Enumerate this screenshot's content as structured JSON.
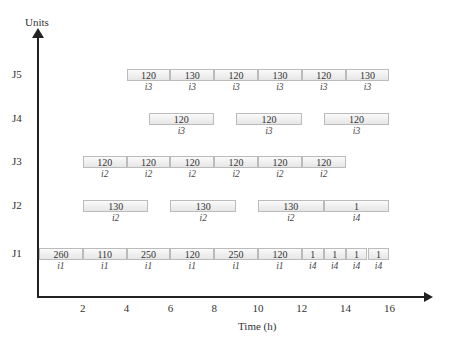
{
  "chart_data": {
    "type": "gantt",
    "title": "",
    "xlabel": "Time (h)",
    "ylabel": "Units",
    "x_ticks": [
      2,
      4,
      6,
      8,
      10,
      12,
      14,
      16
    ],
    "y_categories": [
      "J1",
      "J2",
      "J3",
      "J4",
      "J5"
    ],
    "xlim": [
      0,
      17.5
    ],
    "grid": false,
    "rows": [
      {
        "unit": "J5",
        "tasks": [
          {
            "start": 4,
            "end": 6,
            "value": "120",
            "label": "i3"
          },
          {
            "start": 6,
            "end": 8,
            "value": "130",
            "label": "i3"
          },
          {
            "start": 8,
            "end": 10,
            "value": "120",
            "label": "i3"
          },
          {
            "start": 10,
            "end": 12,
            "value": "130",
            "label": "i3"
          },
          {
            "start": 12,
            "end": 14,
            "value": "120",
            "label": "i3"
          },
          {
            "start": 14,
            "end": 16,
            "value": "130",
            "label": "i3"
          }
        ]
      },
      {
        "unit": "J4",
        "tasks": [
          {
            "start": 5,
            "end": 8,
            "value": "120",
            "label": "i3"
          },
          {
            "start": 9,
            "end": 12,
            "value": "120",
            "label": "i3"
          },
          {
            "start": 13,
            "end": 16,
            "value": "120",
            "label": "i3"
          }
        ]
      },
      {
        "unit": "J3",
        "tasks": [
          {
            "start": 2,
            "end": 4,
            "value": "120",
            "label": "i2"
          },
          {
            "start": 4,
            "end": 6,
            "value": "120",
            "label": "i2"
          },
          {
            "start": 6,
            "end": 8,
            "value": "120",
            "label": "i2"
          },
          {
            "start": 8,
            "end": 10,
            "value": "120",
            "label": "i2"
          },
          {
            "start": 10,
            "end": 12,
            "value": "120",
            "label": "i2"
          },
          {
            "start": 12,
            "end": 14,
            "value": "120",
            "label": "i2"
          }
        ]
      },
      {
        "unit": "J2",
        "tasks": [
          {
            "start": 2,
            "end": 5,
            "value": "130",
            "label": "i2"
          },
          {
            "start": 6,
            "end": 9,
            "value": "130",
            "label": "i2"
          },
          {
            "start": 10,
            "end": 13,
            "value": "130",
            "label": "i2"
          },
          {
            "start": 13,
            "end": 16,
            "value": "1",
            "label": "i4"
          }
        ]
      },
      {
        "unit": "J1",
        "tasks": [
          {
            "start": 0,
            "end": 2,
            "value": "260",
            "label": "i1"
          },
          {
            "start": 2,
            "end": 4,
            "value": "110",
            "label": "i1"
          },
          {
            "start": 4,
            "end": 6,
            "value": "250",
            "label": "i1"
          },
          {
            "start": 6,
            "end": 8,
            "value": "120",
            "label": "i1"
          },
          {
            "start": 8,
            "end": 10,
            "value": "250",
            "label": "i1"
          },
          {
            "start": 10,
            "end": 12,
            "value": "120",
            "label": "i1"
          },
          {
            "start": 12,
            "end": 13,
            "value": "1",
            "label": "i4"
          },
          {
            "start": 13,
            "end": 14,
            "value": "1",
            "label": "i4"
          },
          {
            "start": 14,
            "end": 15,
            "value": "1",
            "label": "i4"
          },
          {
            "start": 15,
            "end": 16,
            "value": "1",
            "label": "i4"
          }
        ]
      }
    ]
  },
  "axes": {
    "ylabel": "Units",
    "xlabel": "Time (h)"
  }
}
